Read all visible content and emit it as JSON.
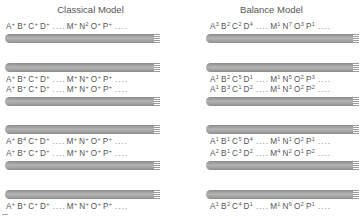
{
  "titles": {
    "classical": "Classical Model",
    "balance": "Balance Model"
  },
  "ellipsis": "....",
  "classical": {
    "rows": [
      {
        "position": "above",
        "letters": [
          [
            "A",
            "+"
          ],
          [
            "B",
            "+"
          ],
          [
            "C",
            "+"
          ],
          [
            "D",
            "+"
          ]
        ],
        "letters2": [
          [
            "M",
            "+"
          ],
          [
            "N",
            "2"
          ],
          [
            "O",
            "+"
          ],
          [
            "P",
            "+"
          ]
        ]
      },
      {
        "position": "below",
        "letters": [
          [
            "A",
            "+"
          ],
          [
            "B",
            "+"
          ],
          [
            "C",
            "+"
          ],
          [
            "D",
            "+"
          ]
        ],
        "letters2": [
          [
            "M",
            "+"
          ],
          [
            "N",
            "+"
          ],
          [
            "O",
            "+"
          ],
          [
            "P",
            "+"
          ]
        ]
      },
      {
        "position": "above",
        "letters": [
          [
            "A",
            "+"
          ],
          [
            "B",
            "+"
          ],
          [
            "C",
            "+"
          ],
          [
            "D",
            "+"
          ]
        ],
        "letters2": [
          [
            "M",
            "+"
          ],
          [
            "N",
            "+"
          ],
          [
            "O",
            "+"
          ],
          [
            "P",
            "+"
          ]
        ]
      },
      {
        "position": "below",
        "letters": [
          [
            "A",
            "+"
          ],
          [
            "B",
            "4"
          ],
          [
            "C",
            "+"
          ],
          [
            "D",
            "+"
          ]
        ],
        "letters2": [
          [
            "M",
            "+"
          ],
          [
            "N",
            "+"
          ],
          [
            "O",
            "+"
          ],
          [
            "P",
            "+"
          ]
        ]
      },
      {
        "position": "above",
        "letters": [
          [
            "A",
            "+"
          ],
          [
            "B",
            "+"
          ],
          [
            "C",
            "+"
          ],
          [
            "D",
            "+"
          ]
        ],
        "letters2": [
          [
            "M",
            "+"
          ],
          [
            "N",
            "+"
          ],
          [
            "O",
            "+"
          ],
          [
            "P",
            "+"
          ]
        ]
      },
      {
        "position": "below",
        "letters": [
          [
            "A",
            "+"
          ],
          [
            "B",
            "+"
          ],
          [
            "C",
            "+"
          ],
          [
            "D",
            "+"
          ]
        ],
        "letters2": [
          [
            "M",
            "+"
          ],
          [
            "N",
            "+"
          ],
          [
            "O",
            "+"
          ],
          [
            "P",
            "+"
          ]
        ]
      }
    ]
  },
  "balance": {
    "rows": [
      {
        "position": "above",
        "letters": [
          [
            "A",
            "3"
          ],
          [
            "B",
            "2"
          ],
          [
            "C",
            "2"
          ],
          [
            "D",
            "4"
          ]
        ],
        "letters2": [
          [
            "M",
            "1"
          ],
          [
            "N",
            "7"
          ],
          [
            "O",
            "3"
          ],
          [
            "P",
            "1"
          ]
        ]
      },
      {
        "position": "below",
        "letters": [
          [
            "A",
            "1"
          ],
          [
            "B",
            "2"
          ],
          [
            "C",
            "5"
          ],
          [
            "D",
            "1"
          ]
        ],
        "letters2": [
          [
            "M",
            "1"
          ],
          [
            "N",
            "5"
          ],
          [
            "O",
            "2"
          ],
          [
            "P",
            "3"
          ]
        ]
      },
      {
        "position": "above",
        "letters": [
          [
            "A",
            "1"
          ],
          [
            "B",
            "3"
          ],
          [
            "C",
            "1"
          ],
          [
            "D",
            "2"
          ]
        ],
        "letters2": [
          [
            "M",
            "1"
          ],
          [
            "N",
            "3"
          ],
          [
            "O",
            "2"
          ],
          [
            "P",
            "2"
          ]
        ]
      },
      {
        "position": "below",
        "letters": [
          [
            "A",
            "1"
          ],
          [
            "B",
            "1"
          ],
          [
            "C",
            "5"
          ],
          [
            "D",
            "4"
          ]
        ],
        "letters2": [
          [
            "M",
            "1"
          ],
          [
            "N",
            "1"
          ],
          [
            "O",
            "2"
          ],
          [
            "P",
            "1"
          ]
        ]
      },
      {
        "position": "above",
        "letters": [
          [
            "A",
            "2"
          ],
          [
            "B",
            "1"
          ],
          [
            "C",
            "3"
          ],
          [
            "D",
            "2"
          ]
        ],
        "letters2": [
          [
            "M",
            "4"
          ],
          [
            "N",
            "2"
          ],
          [
            "O",
            "1"
          ],
          [
            "P",
            "2"
          ]
        ]
      },
      {
        "position": "below",
        "letters": [
          [
            "A",
            "1"
          ],
          [
            "B",
            "2"
          ],
          [
            "C",
            "4"
          ],
          [
            "D",
            "1"
          ]
        ],
        "letters2": [
          [
            "M",
            "1"
          ],
          [
            "N",
            "6"
          ],
          [
            "O",
            "2"
          ],
          [
            "P",
            "1"
          ]
        ]
      }
    ]
  },
  "colors": {
    "text": "#555555",
    "bar_dark": "#8a8a8a",
    "bar_light": "#b4b4b4",
    "background": "#ffffff"
  }
}
